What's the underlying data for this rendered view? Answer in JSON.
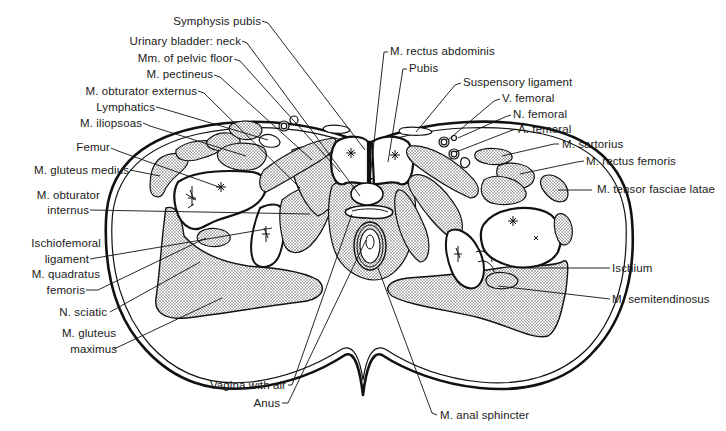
{
  "diagram": {
    "labels_left": [
      {
        "id": "symphysis_pubis",
        "text": "Symphysis pubis"
      },
      {
        "id": "urinary_bladder_neck",
        "text": "Urinary bladder: neck"
      },
      {
        "id": "mm_pelvic_floor",
        "text": "Mm. of pelvic floor"
      },
      {
        "id": "m_pectineus",
        "text": "M. pectineus"
      },
      {
        "id": "m_obturator_externus",
        "text": "M. obturator externus"
      },
      {
        "id": "lymphatics",
        "text": "Lymphatics"
      },
      {
        "id": "m_iliopsoas",
        "text": "M. iliopsoas"
      },
      {
        "id": "femur",
        "text": "Femur"
      },
      {
        "id": "m_gluteus_medius",
        "text": "M. gluteus medius"
      },
      {
        "id": "m_obturator_internus_1",
        "text": "M. obturator"
      },
      {
        "id": "m_obturator_internus_2",
        "text": "internus"
      },
      {
        "id": "ischiofemoral_ligament_1",
        "text": "Ischiofemoral"
      },
      {
        "id": "ischiofemoral_ligament_2",
        "text": "ligament"
      },
      {
        "id": "m_quadratus_femoris_1",
        "text": "M. quadratus"
      },
      {
        "id": "m_quadratus_femoris_2",
        "text": "femoris"
      },
      {
        "id": "n_sciatic",
        "text": "N. sciatic"
      },
      {
        "id": "m_gluteus_maximus_1",
        "text": "M. gluteus"
      },
      {
        "id": "m_gluteus_maximus_2",
        "text": "maximus"
      }
    ],
    "labels_right": [
      {
        "id": "m_rectus_abdominis",
        "text": "M. rectus abdominis"
      },
      {
        "id": "pubis",
        "text": "Pubis"
      },
      {
        "id": "suspensory_ligament",
        "text": "Suspensory ligament"
      },
      {
        "id": "v_femoral",
        "text": "V. femoral"
      },
      {
        "id": "n_femoral",
        "text": "N. femoral"
      },
      {
        "id": "a_femoral",
        "text": "A. femoral"
      },
      {
        "id": "m_sartorius",
        "text": "M. sartorius"
      },
      {
        "id": "m_rectus_femoris",
        "text": "M. rectus femoris"
      },
      {
        "id": "m_tensor_fasciae_latae",
        "text": "M. tensor fasciae latae"
      },
      {
        "id": "ischium",
        "text": "Ischium"
      },
      {
        "id": "m_semitendinosus",
        "text": "M. semitendinosus"
      }
    ],
    "labels_bottom": [
      {
        "id": "vagina_with_air",
        "text": "Vagina with air"
      },
      {
        "id": "anus",
        "text": "Anus"
      },
      {
        "id": "m_anal_sphincter",
        "text": "M. anal sphincter"
      }
    ],
    "colors": {
      "ink": "#111111",
      "stipple": "#c9c9c9",
      "background": "#ffffff"
    }
  }
}
